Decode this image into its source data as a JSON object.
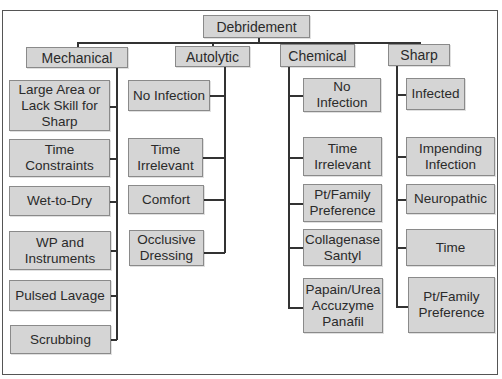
{
  "diagram": {
    "root": "Debridement",
    "categories": [
      {
        "label": "Mechanical",
        "items": [
          "Large Area or\nLack Skill for\nSharp",
          "Time Constraints",
          "Wet-to-Dry",
          "WP and\nInstruments",
          "Pulsed Lavage",
          "Scrubbing"
        ]
      },
      {
        "label": "Autolytic",
        "items": [
          "No Infection",
          "Time\nIrrelevant",
          "Comfort",
          "Occlusive\nDressing"
        ]
      },
      {
        "label": "Chemical",
        "items": [
          "No Infection",
          "Time\nIrrelevant",
          "Pt/Family\nPreference",
          "Collagenase\nSantyl",
          "Papain/Urea\nAccuzyme\nPanafil"
        ]
      },
      {
        "label": "Sharp",
        "items": [
          "Infected",
          "Impending\nInfection",
          "Neuropathic",
          "Time",
          "Pt/Family\nPreference"
        ]
      }
    ]
  },
  "colors": {
    "node_fill": "#d5d5d5",
    "node_border": "#8a8a8a",
    "connector": "#333333",
    "text": "#2a2a2a"
  }
}
